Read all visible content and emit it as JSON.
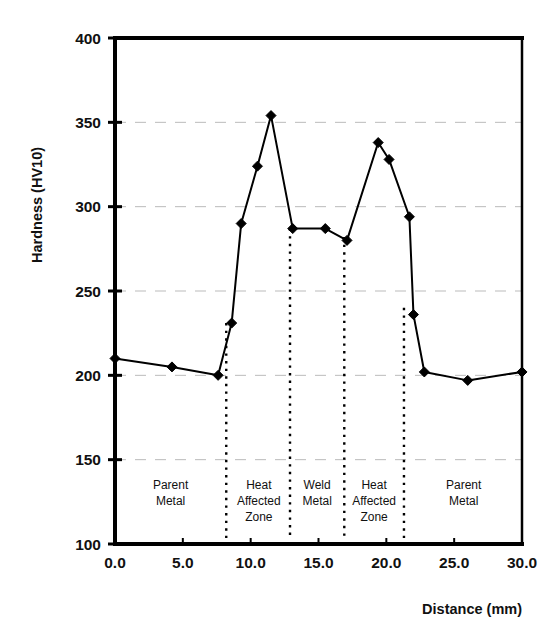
{
  "chart_data": {
    "type": "line",
    "title": "",
    "xlabel": "Distance (mm)",
    "ylabel": "Hardness (HV10)",
    "xlim": [
      0,
      30
    ],
    "ylim": [
      100,
      400
    ],
    "xticks": [
      "0.0",
      "5.0",
      "10.0",
      "15.0",
      "20.0",
      "25.0",
      "30.0"
    ],
    "xtick_values": [
      0,
      5,
      10,
      15,
      20,
      25,
      30
    ],
    "yticks": [
      "100",
      "150",
      "200",
      "250",
      "300",
      "350",
      "400"
    ],
    "ytick_values": [
      100,
      150,
      200,
      250,
      300,
      350,
      400
    ],
    "grid": "horizontal-dashed",
    "legend": "none",
    "marker": "diamond",
    "series": [
      {
        "name": "Hardness traverse",
        "x": [
          0.0,
          4.2,
          7.6,
          8.6,
          9.3,
          10.5,
          11.5,
          13.1,
          15.5,
          17.1,
          19.4,
          20.2,
          21.7,
          22.0,
          22.8,
          26.0,
          30.0
        ],
        "values": [
          210,
          205,
          200,
          231,
          290,
          324,
          354,
          287,
          287,
          280,
          338,
          328,
          294,
          236,
          202,
          197,
          202
        ]
      }
    ],
    "dividers": [
      {
        "x": 8.2,
        "style": "dotted",
        "y_top": 231,
        "y_bottom": 100
      },
      {
        "x": 12.9,
        "style": "dotted",
        "y_top": 287,
        "y_bottom": 100
      },
      {
        "x": 16.9,
        "style": "dotted",
        "y_top": 282,
        "y_bottom": 100
      },
      {
        "x": 21.3,
        "style": "dotted",
        "y_top": 240,
        "y_bottom": 100
      }
    ],
    "zone_annotations": [
      {
        "label_lines": [
          "Parent",
          "Metal"
        ],
        "x_center": 4.1
      },
      {
        "label_lines": [
          "Heat",
          "Affected",
          "Zone"
        ],
        "x_center": 10.6
      },
      {
        "label_lines": [
          "Weld",
          "Metal"
        ],
        "x_center": 14.9
      },
      {
        "label_lines": [
          "Heat",
          "Affected",
          "Zone"
        ],
        "x_center": 19.1
      },
      {
        "label_lines": [
          "Parent",
          "Metal"
        ],
        "x_center": 25.7
      }
    ],
    "colors": {
      "line": "#000000",
      "marker": "#000000",
      "axis": "#000000",
      "grid": "#bbbbbb",
      "divider": "#000000",
      "background": "#ffffff"
    }
  }
}
